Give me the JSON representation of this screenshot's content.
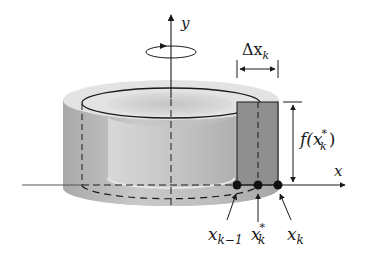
{
  "figure": {
    "colors": {
      "background": "#ffffff",
      "ink": "#1a1a1a",
      "shell_outer": "#b8b8b8",
      "shell_top": "#dcdcdc",
      "inner_wall": "#cfcfcf",
      "rectangle": "#8f8f8f"
    },
    "axes": {
      "y_label": "y",
      "x_label": "x"
    },
    "rotation_icon": "rotation-arrow-icon",
    "labels": {
      "delta_x": {
        "main": "Δx",
        "sub": "k"
      },
      "height": {
        "pre": "f(",
        "var": "x",
        "sup": "*",
        "sub": "k",
        "post": ")"
      },
      "x_k_minus_1": {
        "main": "x",
        "sub": "k−1"
      },
      "x_k_star": {
        "main": "x",
        "sup": "*",
        "sub": "k"
      },
      "x_k": {
        "main": "x",
        "sub": "k"
      }
    }
  }
}
